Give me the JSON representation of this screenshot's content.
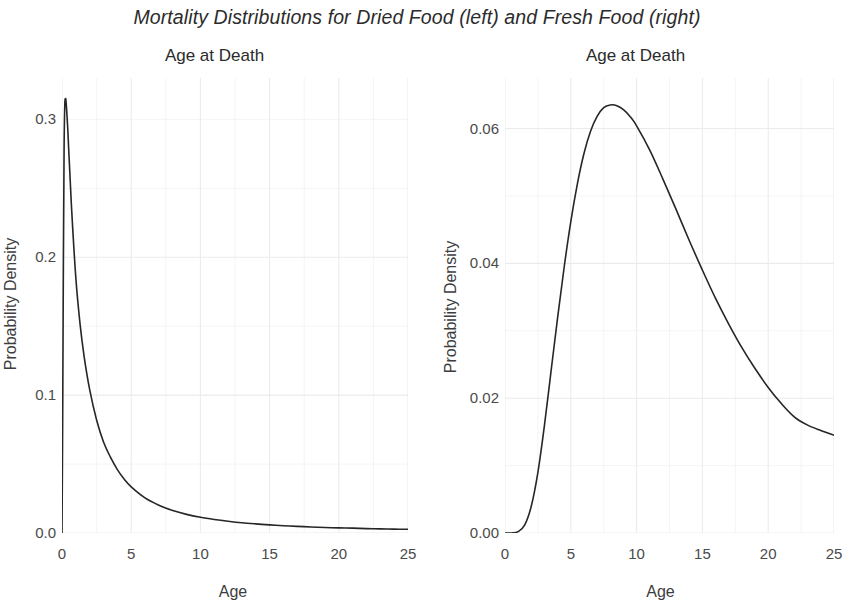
{
  "figure": {
    "suptitle": "Mortality Distributions for Dried Food (left) and Fresh Food (right)",
    "background": "#ffffff",
    "line_color": "#262626",
    "grid_color": "#ebebeb",
    "text_color": "#3d3d3d"
  },
  "chart_data": [
    {
      "type": "line",
      "panel": "left",
      "title": "Age at Death",
      "xlabel": "Age",
      "ylabel": "Probability Density",
      "xlim": [
        0,
        25
      ],
      "ylim": [
        0,
        0.33
      ],
      "xticks": [
        "0",
        "5",
        "10",
        "15",
        "20",
        "25"
      ],
      "xtick_values": [
        0,
        5,
        10,
        15,
        20,
        25
      ],
      "yticks": [
        "0.0",
        "0.1",
        "0.2",
        "0.3"
      ],
      "ytick_values": [
        0.0,
        0.1,
        0.2,
        0.3
      ],
      "grid": true,
      "legend": "none",
      "series": [
        {
          "name": "Dried Food mortality density",
          "description": "Sharply peaked, heavily right-skewed density: near-vertical rise from 0 at age 0 to a peak of about 0.315 near age 0.25, then rapid exponential-like decay to a long flat tail approaching 0.004 at age 25.",
          "x": [
            0,
            0.05,
            0.1,
            0.15,
            0.2,
            0.25,
            0.3,
            0.4,
            0.5,
            0.7,
            1.0,
            1.3,
            1.6,
            2.0,
            2.5,
            3.0,
            3.5,
            4.0,
            4.5,
            5.0,
            6.0,
            7.0,
            8.0,
            9.0,
            10.0,
            11.0,
            12.0,
            13.0,
            14.0,
            15.0,
            16.0,
            17.0,
            18.0,
            19.0,
            20.0,
            21.0,
            22.0,
            23.0,
            24.0,
            25.0
          ],
          "y": [
            0.0,
            0.085,
            0.195,
            0.278,
            0.31,
            0.315,
            0.312,
            0.296,
            0.275,
            0.234,
            0.185,
            0.152,
            0.128,
            0.104,
            0.082,
            0.066,
            0.055,
            0.046,
            0.039,
            0.0335,
            0.0255,
            0.0202,
            0.0163,
            0.0135,
            0.0114,
            0.0098,
            0.0085,
            0.0074,
            0.0066,
            0.0059,
            0.0053,
            0.0048,
            0.0044,
            0.004,
            0.0037,
            0.0035,
            0.0032,
            0.003,
            0.0028,
            0.0027
          ]
        }
      ]
    },
    {
      "type": "line",
      "panel": "right",
      "title": "Age at Death",
      "xlabel": "Age",
      "ylabel": "Probability Density",
      "xlim": [
        0,
        25
      ],
      "ylim": [
        0,
        0.0675
      ],
      "xticks": [
        "0",
        "5",
        "10",
        "15",
        "20",
        "25"
      ],
      "xtick_values": [
        0,
        5,
        10,
        15,
        20,
        25
      ],
      "yticks": [
        "0.00",
        "0.02",
        "0.04",
        "0.06"
      ],
      "ytick_values": [
        0.0,
        0.02,
        0.04,
        0.06
      ],
      "grid": true,
      "legend": "none",
      "series": [
        {
          "name": "Fresh Food mortality density",
          "description": "Unimodal, mildly right-skewed density: flat near 0 until about age 1.5, steep rise, peak of about 0.0635 near age 8.5, then a gradual decline to about 0.0145 at age 25.",
          "x": [
            0,
            0.5,
            1.0,
            1.5,
            2.0,
            2.5,
            3.0,
            3.5,
            4.0,
            4.5,
            5.0,
            5.5,
            6.0,
            6.5,
            7.0,
            7.5,
            8.0,
            8.5,
            9.0,
            9.5,
            10.0,
            11.0,
            12.0,
            13.0,
            14.0,
            15.0,
            16.0,
            17.0,
            18.0,
            19.0,
            20.0,
            21.0,
            22.0,
            23.0,
            24.0,
            25.0
          ],
          "y": [
            0.0,
            0.0,
            0.0002,
            0.0012,
            0.004,
            0.009,
            0.016,
            0.024,
            0.032,
            0.0395,
            0.0462,
            0.0518,
            0.0563,
            0.0596,
            0.0618,
            0.0631,
            0.0635,
            0.0634,
            0.0628,
            0.0618,
            0.0604,
            0.0568,
            0.0525,
            0.048,
            0.0434,
            0.039,
            0.0348,
            0.031,
            0.0275,
            0.0244,
            0.0216,
            0.0192,
            0.0172,
            0.016,
            0.0152,
            0.0145
          ]
        }
      ]
    }
  ]
}
